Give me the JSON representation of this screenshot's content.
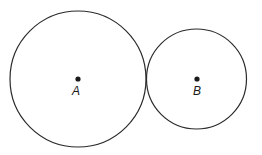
{
  "diagram": {
    "circles": [
      {
        "id": "A",
        "label": "A",
        "relative_size": "larger"
      },
      {
        "id": "B",
        "label": "B",
        "relative_size": "smaller"
      }
    ],
    "relationship": "tangent externally",
    "colors": {
      "stroke": "#2a2a2a",
      "point": "#1a1a1a",
      "background": "#ffffff"
    }
  }
}
